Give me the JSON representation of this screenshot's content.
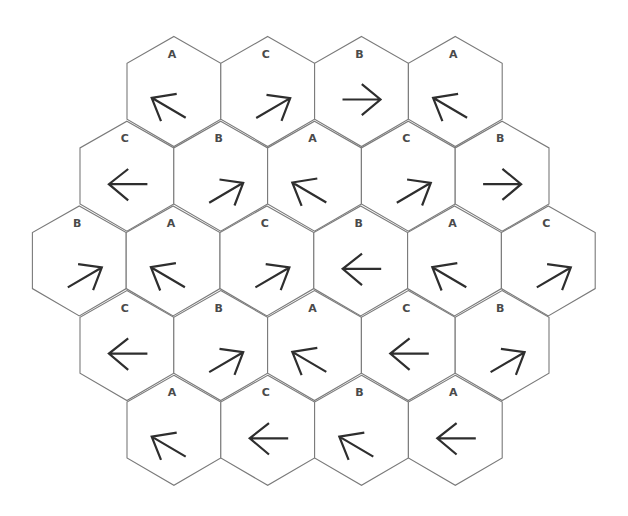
{
  "diagram": {
    "colors": {
      "background": "#ffffff",
      "hex_stroke": "#7a7a7a",
      "arrow_stroke": "#2e2e2e",
      "label": "#4a4a4a"
    },
    "geometry": {
      "hex_width": 93.8,
      "row_spacing": 84.7,
      "first_row_center_y": 91.5
    },
    "rows": [
      {
        "first_center_x": 173.9,
        "cells": [
          {
            "label": "A",
            "arrow": "up-left"
          },
          {
            "label": "C",
            "arrow": "up-right"
          },
          {
            "label": "B",
            "arrow": "right"
          },
          {
            "label": "A",
            "arrow": "up-left"
          }
        ]
      },
      {
        "first_center_x": 126.9,
        "cells": [
          {
            "label": "C",
            "arrow": "left"
          },
          {
            "label": "B",
            "arrow": "up-right"
          },
          {
            "label": "A",
            "arrow": "up-left"
          },
          {
            "label": "C",
            "arrow": "up-right"
          },
          {
            "label": "B",
            "arrow": "right"
          }
        ]
      },
      {
        "first_center_x": 79.3,
        "cells": [
          {
            "label": "B",
            "arrow": "up-right"
          },
          {
            "label": "A",
            "arrow": "up-left"
          },
          {
            "label": "C",
            "arrow": "up-right"
          },
          {
            "label": "B",
            "arrow": "left"
          },
          {
            "label": "A",
            "arrow": "up-left"
          },
          {
            "label": "C",
            "arrow": "up-right"
          }
        ]
      },
      {
        "first_center_x": 126.9,
        "cells": [
          {
            "label": "C",
            "arrow": "left"
          },
          {
            "label": "B",
            "arrow": "up-right"
          },
          {
            "label": "A",
            "arrow": "up-left"
          },
          {
            "label": "C",
            "arrow": "left"
          },
          {
            "label": "B",
            "arrow": "up-right"
          }
        ]
      },
      {
        "first_center_x": 173.9,
        "cells": [
          {
            "label": "A",
            "arrow": "up-left"
          },
          {
            "label": "C",
            "arrow": "left"
          },
          {
            "label": "B",
            "arrow": "up-left"
          },
          {
            "label": "A",
            "arrow": "left"
          }
        ]
      }
    ]
  }
}
